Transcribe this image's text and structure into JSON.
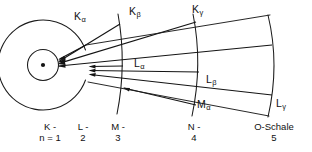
{
  "figure": {
    "type": "atomic-shell-transition-diagram",
    "language": "de",
    "background_color": "#ffffff",
    "line_color": "#141414"
  },
  "transition_labels": [
    {
      "id": "k-alpha",
      "base": "K",
      "sub": "α",
      "x": 74,
      "y": 11
    },
    {
      "id": "k-beta",
      "base": "K",
      "sub": "β",
      "x": 129,
      "y": 6
    },
    {
      "id": "k-gamma",
      "base": "K",
      "sub": "γ",
      "x": 192,
      "y": 4
    },
    {
      "id": "l-alpha",
      "base": "L",
      "sub": "α",
      "x": 134,
      "y": 58
    },
    {
      "id": "l-beta",
      "base": "L",
      "sub": "β",
      "x": 206,
      "y": 74
    },
    {
      "id": "m-alpha",
      "base": "M",
      "sub": "α",
      "x": 197,
      "y": 99
    },
    {
      "id": "l-gamma",
      "base": "L",
      "sub": "γ",
      "x": 276,
      "y": 98
    }
  ],
  "shell_labels": [
    {
      "id": "shell-k",
      "line1": "K -",
      "line2": "n = 1",
      "x": 26,
      "y": 121,
      "width": 48
    },
    {
      "id": "shell-l",
      "line1": "L -",
      "line2": "2",
      "x": 66,
      "y": 121,
      "width": 34
    },
    {
      "id": "shell-m",
      "line1": "M -",
      "line2": "3",
      "x": 101,
      "y": 121,
      "width": 34
    },
    {
      "id": "shell-n",
      "line1": "N -",
      "line2": "4",
      "x": 177,
      "y": 121,
      "width": 34
    },
    {
      "id": "shell-o",
      "line1": "O-Schale",
      "line2": "5",
      "x": 244,
      "y": 121,
      "width": 60
    }
  ],
  "geometry": {
    "nucleus": {
      "cx": 43,
      "cy": 65,
      "r": 2.1
    },
    "k_shell_circle": {
      "cx": 43,
      "cy": 65,
      "r": 15.5
    },
    "l_shell_arc_radius": 45,
    "shell_arc_centers_x": [
      43,
      88,
      122,
      198,
      274
    ],
    "k_convergence_point": {
      "x": 58,
      "y": 63
    },
    "l_convergence_point": {
      "x": 88,
      "y": 70
    }
  }
}
